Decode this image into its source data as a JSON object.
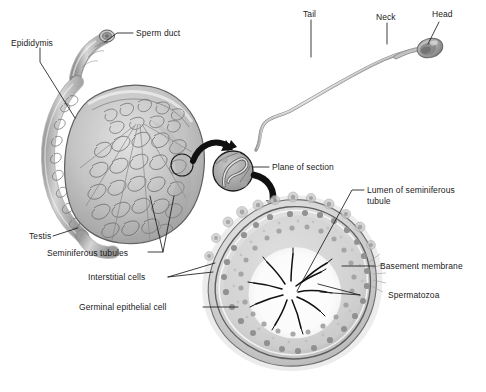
{
  "figure": {
    "background_color": "#ffffff",
    "ink_color": "#1b1b1b",
    "tissue_mid_gray": "#b9b9b9",
    "tissue_dark_gray": "#8a8a8a",
    "tissue_light_gray": "#dcdcdc",
    "nucleus_gray": "#9a9a9a",
    "width": 486,
    "height": 392
  },
  "labels": {
    "epididymis": "Epididymis",
    "sperm_duct": "Sperm duct",
    "testis": "Testis",
    "seminiferous_tubules": "Seminiferous tubules",
    "interstitial_cells": "Interstitial cells",
    "germinal_epithelial_cell": "Germinal epithelial cell",
    "tail": "Tail",
    "neck": "Neck",
    "head": "Head",
    "plane_of_section": "Plane of section",
    "lumen_of_seminiferous_tubule": "Lumen of seminiferous\ntubule",
    "basement_membrane": "Basement membrane",
    "spermatozoa": "Spermatozoa"
  },
  "panels": {
    "testis_section": {
      "name": "Longitudinal section of testis and epididymis",
      "parts": [
        "Epididymis",
        "Sperm duct",
        "Testis",
        "Seminiferous tubules"
      ]
    },
    "spermatozoon": {
      "name": "Single spermatozoon",
      "parts": [
        "Head",
        "Neck",
        "Tail"
      ]
    },
    "magnifier": {
      "name": "Magnified lobule with plane of section",
      "parts": [
        "Plane of section"
      ]
    },
    "tubule_cross_section": {
      "name": "Transverse section of a seminiferous tubule",
      "parts": [
        "Lumen of seminiferous tubule",
        "Basement membrane",
        "Spermatozoa",
        "Interstitial cells",
        "Germinal epithelial cell"
      ]
    }
  }
}
